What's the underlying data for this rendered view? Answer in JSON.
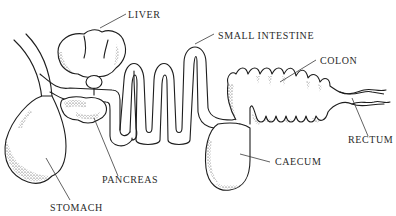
{
  "diagram": {
    "type": "anatomical line drawing",
    "labels": {
      "liver": "LIVER",
      "small_intestine": "SMALL INTESTINE",
      "colon": "COLON",
      "rectum": "RECTUM",
      "caecum": "CAECUM",
      "pancreas": "PANCREAS",
      "stomach": "STOMACH"
    },
    "colors": {
      "line": "#1e1e1e",
      "text": "#2a2a2a",
      "background": "#ffffff"
    }
  }
}
